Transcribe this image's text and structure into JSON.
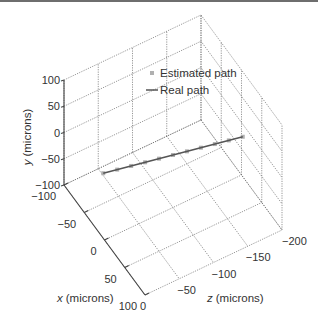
{
  "chart_data": {
    "type": "line3d",
    "title": "",
    "axes": {
      "x": {
        "label_var": "x",
        "label_unit": "(microns)",
        "range": [
          -100,
          100
        ],
        "ticks": [
          -100,
          -50,
          0,
          50,
          100
        ]
      },
      "y": {
        "label_var": "y",
        "label_unit": "(microns)",
        "range": [
          -100,
          100
        ],
        "ticks": [
          -100,
          -50,
          0,
          50,
          100
        ]
      },
      "z": {
        "label_var": "z",
        "label_unit": "(microns)",
        "range": [
          -200,
          0
        ],
        "ticks": [
          0,
          -50,
          -100,
          -150,
          -200
        ]
      }
    },
    "grid": true,
    "legend": {
      "position": "upper-center",
      "entries": [
        {
          "label": "Estimated path",
          "style": "marker",
          "color": "#b0b0b0"
        },
        {
          "label": "Real path",
          "style": "line",
          "color": "#555555"
        }
      ]
    },
    "series": [
      {
        "name": "Real path",
        "color": "#555555",
        "points": [
          [
            -20,
            0,
            -10
          ],
          [
            20,
            0,
            -190
          ]
        ]
      },
      {
        "name": "Estimated path",
        "color": "#b0b0b0",
        "points": [
          [
            -20,
            0,
            -10
          ],
          [
            -16,
            0,
            -28
          ],
          [
            -12,
            0,
            -46
          ],
          [
            -8,
            0,
            -64
          ],
          [
            -4,
            0,
            -82
          ],
          [
            0,
            0,
            -100
          ],
          [
            4,
            0,
            -118
          ],
          [
            8,
            0,
            -136
          ],
          [
            12,
            0,
            -154
          ],
          [
            16,
            0,
            -172
          ],
          [
            20,
            0,
            -190
          ]
        ]
      }
    ]
  }
}
